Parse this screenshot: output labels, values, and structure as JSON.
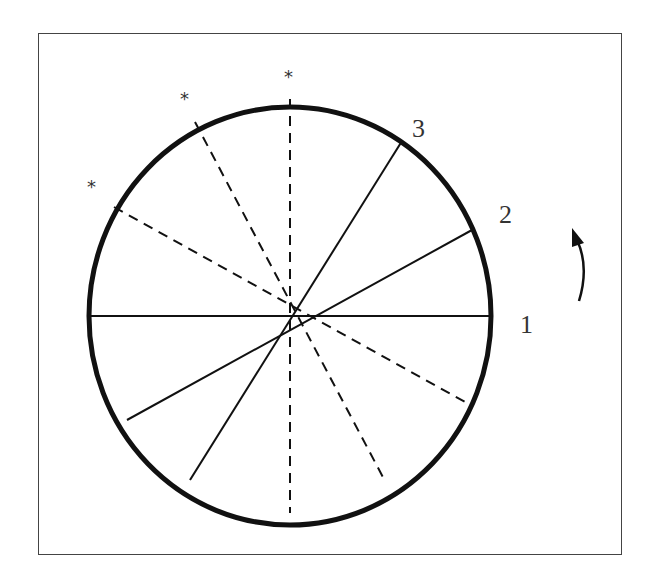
{
  "diagram": {
    "type": "rotating-disk-sector-diagram",
    "frame": {
      "border_color": "#444444"
    },
    "circle": {
      "cx": 290,
      "cy": 316,
      "rx": 201,
      "ry": 209,
      "stroke": "#111111",
      "stroke_width": 5
    },
    "solid_lines": [
      {
        "id": "line-1",
        "angle_deg": 0,
        "label": "1"
      },
      {
        "id": "line-2",
        "angle_deg": 25,
        "label": "2"
      },
      {
        "id": "line-3",
        "angle_deg": 57,
        "label": "3"
      }
    ],
    "dashed_lines": [
      {
        "id": "dashed-90",
        "angle_deg": 90,
        "marker": "*"
      },
      {
        "id": "dashed-116",
        "angle_deg": 116,
        "marker": "*"
      },
      {
        "id": "dashed-148",
        "angle_deg": 148,
        "marker": "*"
      }
    ],
    "labels": {
      "one": "1",
      "two": "2",
      "three": "3",
      "star": "*"
    },
    "rotation_arrow": {
      "direction": "counterclockwise",
      "glyph": "curved-up-arrow"
    }
  }
}
